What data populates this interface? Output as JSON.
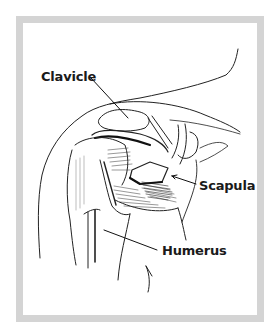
{
  "figure": {
    "frame_color": "#d4d4d4",
    "labels": [
      {
        "text": "Clavicle",
        "x": 41,
        "y": 70
      },
      {
        "text": "Scapula",
        "x": 199,
        "y": 179
      },
      {
        "text": "Humerus",
        "x": 162,
        "y": 246
      }
    ]
  }
}
